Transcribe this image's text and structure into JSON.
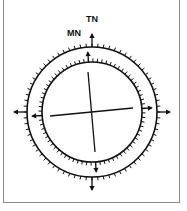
{
  "figure": {
    "labels": {
      "true_north": "TN",
      "magnetic_north": "MN"
    },
    "outer_ring": {
      "name": "true-north-ring",
      "tick_count": 72,
      "cardinal_arrows": [
        "N",
        "E",
        "S",
        "W"
      ]
    },
    "inner_ring": {
      "name": "magnetic-north-ring",
      "tick_count": 72,
      "cardinal_arrows": [
        "N",
        "E",
        "S",
        "W"
      ]
    },
    "declination_deg": -4,
    "colors": {
      "ink": "#111111",
      "frame": "#8a8a8a",
      "background": "#ffffff"
    }
  }
}
